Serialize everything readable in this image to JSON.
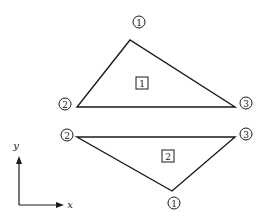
{
  "diagram": {
    "stroke_color": "#1a1a1a",
    "elements": [
      {
        "label": "1",
        "nodes": [
          {
            "label": "1",
            "x": 130,
            "y": 40
          },
          {
            "label": "2",
            "x": 77,
            "y": 107
          },
          {
            "label": "3",
            "x": 235,
            "y": 107
          }
        ]
      },
      {
        "label": "2",
        "nodes": [
          {
            "label": "1",
            "x": 172,
            "y": 191
          },
          {
            "label": "2",
            "x": 77,
            "y": 137
          },
          {
            "label": "3",
            "x": 235,
            "y": 137
          }
        ]
      }
    ],
    "axes": {
      "x_label": "x",
      "y_label": "y"
    }
  }
}
